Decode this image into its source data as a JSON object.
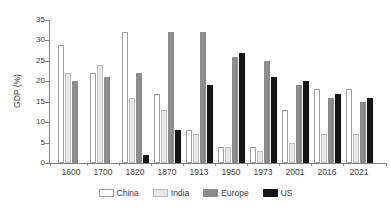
{
  "chart_data": {
    "type": "bar",
    "title": "",
    "xlabel": "",
    "ylabel": "GDP (%)",
    "ylim": [
      0,
      35
    ],
    "yticks": [
      0,
      5,
      10,
      15,
      20,
      25,
      30,
      35
    ],
    "grid": false,
    "legend_position": "bottom-center",
    "background_color": "#ffffff",
    "axis_color": "#808080",
    "text_color": "#404040",
    "categories": [
      "1600",
      "1700",
      "1820",
      "1870",
      "1913",
      "1950",
      "1973",
      "2001",
      "2016",
      "2021"
    ],
    "series": [
      {
        "name": "China",
        "fill": "#ffffff",
        "border": "#9e9e9e",
        "values": [
          29,
          22,
          32,
          17,
          8,
          4,
          4,
          13,
          18,
          18
        ]
      },
      {
        "name": "India",
        "fill": "#e7e7e7",
        "border": "#bdbdbd",
        "values": [
          22,
          24,
          16,
          13,
          7,
          4,
          3,
          5,
          7,
          7
        ]
      },
      {
        "name": "Europe",
        "fill": "#8c8c8c",
        "border": "#8c8c8c",
        "values": [
          20,
          21,
          22,
          32,
          32,
          26,
          25,
          19,
          16,
          15
        ]
      },
      {
        "name": "US",
        "fill": "#141414",
        "border": "#141414",
        "values": [
          0,
          0,
          2,
          8,
          19,
          27,
          21,
          20,
          17,
          16
        ]
      }
    ]
  }
}
